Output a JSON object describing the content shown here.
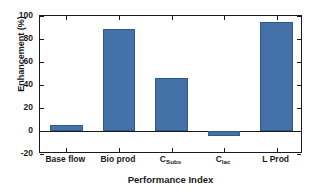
{
  "chart_data": {
    "type": "bar",
    "title": "",
    "xlabel": "Performance Index",
    "ylabel": "Enhancement (%)",
    "categories": [
      "Base flow",
      "Bio prod",
      "C_Subs",
      "C_lac",
      "L Prod"
    ],
    "category_labels": [
      {
        "base": "Base flow",
        "sub": ""
      },
      {
        "base": "Bio prod",
        "sub": ""
      },
      {
        "base": "C",
        "sub": "Subs"
      },
      {
        "base": "C",
        "sub": "lac"
      },
      {
        "base": "L Prod",
        "sub": ""
      }
    ],
    "values": [
      5,
      89,
      46,
      -4,
      95
    ],
    "ylim": [
      -20,
      100
    ],
    "yticks": [
      -20,
      0,
      20,
      40,
      60,
      80,
      100
    ],
    "ytick_labels": [
      "-20",
      "0",
      "20",
      "40",
      "60",
      "80",
      "100"
    ],
    "grid": false,
    "legend": null,
    "bar_color": "#4472a8",
    "bar_edge_color": "#31588a",
    "axis_color": "#1a1a1a",
    "background": "#ffffff"
  }
}
